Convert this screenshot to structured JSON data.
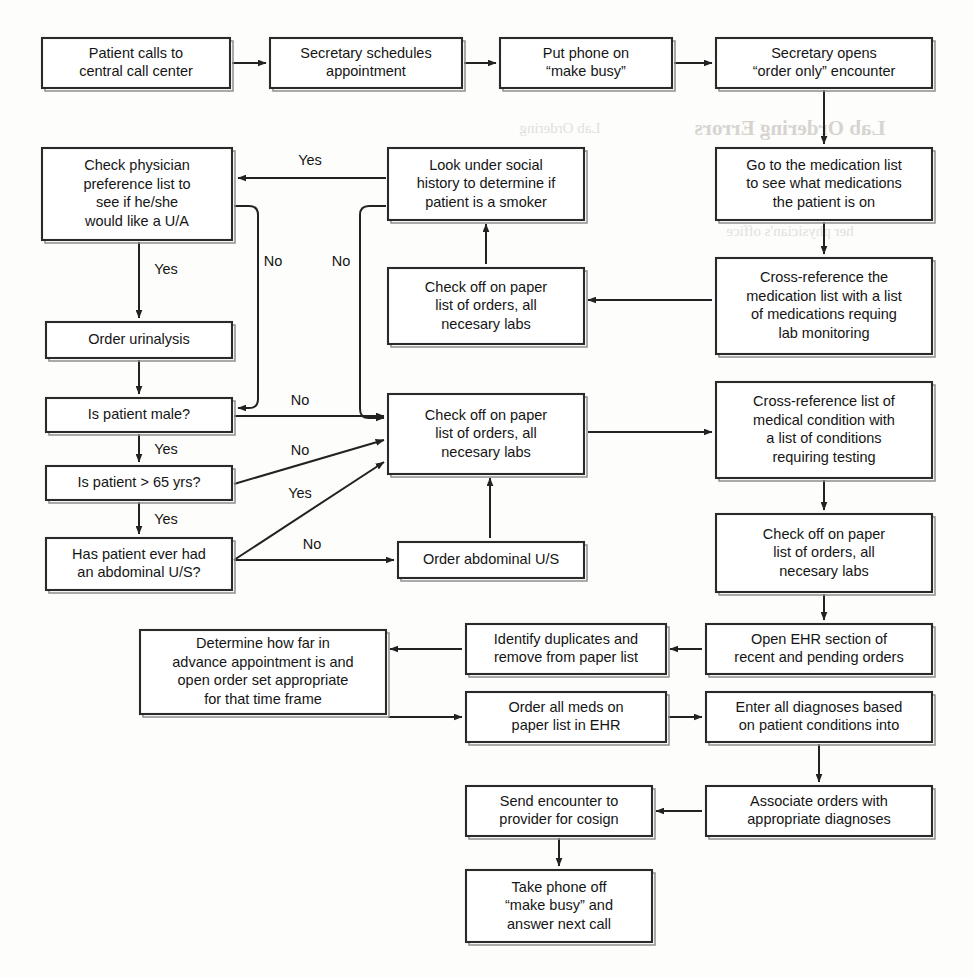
{
  "document": {
    "title": "Clinical Pre-Visit Lab Ordering Workflow",
    "page_background": "#fdfdfc",
    "ink_color": "#222222",
    "box_fill": "#ffffff"
  },
  "chart_data": {
    "type": "diagram",
    "diagram_kind": "flowchart",
    "orientation": "mixed",
    "node_count": 23,
    "edge_count": 26,
    "nodes": [
      {
        "id": "n1",
        "label": "Patient calls to\ncentral call center",
        "x": 42,
        "y": 38,
        "w": 188,
        "h": 50
      },
      {
        "id": "n2",
        "label": "Secretary schedules\nappointment",
        "x": 270,
        "y": 38,
        "w": 192,
        "h": 50
      },
      {
        "id": "n3",
        "label": "Put phone on\n“make busy”",
        "x": 500,
        "y": 38,
        "w": 172,
        "h": 50
      },
      {
        "id": "n4",
        "label": "Secretary opens\n“order only” encounter",
        "x": 716,
        "y": 38,
        "w": 216,
        "h": 50
      },
      {
        "id": "n5",
        "label": "Check physician\npreference list to\nsee if he/she\nwould like a U/A",
        "x": 42,
        "y": 148,
        "w": 190,
        "h": 92
      },
      {
        "id": "n6",
        "label": "Look under social\nhistory to determine if\npatient is a smoker",
        "x": 388,
        "y": 148,
        "w": 196,
        "h": 72
      },
      {
        "id": "n7",
        "label": "Go to the medication list\nto see what medications\nthe patient is on",
        "x": 716,
        "y": 148,
        "w": 216,
        "h": 72
      },
      {
        "id": "n8",
        "label": "Check off on paper\nlist of orders, all\nnecesary labs",
        "x": 388,
        "y": 268,
        "w": 196,
        "h": 76
      },
      {
        "id": "n9",
        "label": "Cross-reference the\nmedication list with a list\nof medications requing\nlab monitoring",
        "x": 716,
        "y": 258,
        "w": 216,
        "h": 96
      },
      {
        "id": "n10",
        "label": "Order urinalysis",
        "x": 46,
        "y": 322,
        "w": 186,
        "h": 36
      },
      {
        "id": "n11",
        "label": "Is patient male?",
        "x": 46,
        "y": 398,
        "w": 186,
        "h": 34
      },
      {
        "id": "n12",
        "label": "Check off on paper\nlist of orders, all\nnecesary labs",
        "x": 388,
        "y": 394,
        "w": 196,
        "h": 80
      },
      {
        "id": "n13",
        "label": "Cross-reference list of\nmedical condition with\na list of conditions\nrequiring testing",
        "x": 716,
        "y": 382,
        "w": 216,
        "h": 96
      },
      {
        "id": "n14",
        "label": "Is patient > 65 yrs?",
        "x": 46,
        "y": 466,
        "w": 186,
        "h": 34
      },
      {
        "id": "n15",
        "label": "Has patient ever had\nan abdominal U/S?",
        "x": 46,
        "y": 538,
        "w": 186,
        "h": 52
      },
      {
        "id": "n16",
        "label": "Order abdominal U/S",
        "x": 398,
        "y": 542,
        "w": 186,
        "h": 36
      },
      {
        "id": "n17",
        "label": "Check off on paper\nlist of orders, all\nnecesary labs",
        "x": 716,
        "y": 514,
        "w": 216,
        "h": 78
      },
      {
        "id": "n18",
        "label": "Open EHR section of\nrecent and pending orders",
        "x": 706,
        "y": 624,
        "w": 226,
        "h": 50
      },
      {
        "id": "n19",
        "label": "Identify duplicates and\nremove from paper list",
        "x": 466,
        "y": 624,
        "w": 200,
        "h": 50
      },
      {
        "id": "n20",
        "label": "Determine how far in\nadvance appointment is and\nopen order set appropriate\nfor that time frame",
        "x": 140,
        "y": 630,
        "w": 246,
        "h": 84
      },
      {
        "id": "n21",
        "label": "Order all meds on\npaper list in EHR",
        "x": 466,
        "y": 692,
        "w": 200,
        "h": 50
      },
      {
        "id": "n22",
        "label": "Enter all diagnoses based\non patient conditions into",
        "x": 706,
        "y": 692,
        "w": 226,
        "h": 50
      },
      {
        "id": "n23",
        "label": "Associate orders with\nappropriate diagnoses",
        "x": 706,
        "y": 786,
        "w": 226,
        "h": 50
      },
      {
        "id": "n24",
        "label": "Send encounter to\nprovider for cosign",
        "x": 466,
        "y": 786,
        "w": 186,
        "h": 50
      },
      {
        "id": "n25",
        "label": "Take phone off\n“make busy” and\nanswer next call",
        "x": 466,
        "y": 870,
        "w": 186,
        "h": 72
      }
    ],
    "edges": [
      {
        "id": "e1",
        "from": "n1",
        "to": "n2",
        "label": "",
        "points": "232,63 266,63",
        "arrow": "end"
      },
      {
        "id": "e2",
        "from": "n2",
        "to": "n3",
        "label": "",
        "points": "464,63 496,63",
        "arrow": "end"
      },
      {
        "id": "e3",
        "from": "n3",
        "to": "n4",
        "label": "",
        "points": "674,63 712,63",
        "arrow": "end"
      },
      {
        "id": "e4",
        "from": "n4",
        "to": "n7",
        "label": "",
        "points": "824,90 824,144",
        "arrow": "end"
      },
      {
        "id": "e5",
        "from": "n6",
        "to": "n5",
        "label": "Yes",
        "points": "386,178 238,178",
        "arrow": "end",
        "label_x": 310,
        "label_y": 161
      },
      {
        "id": "e6",
        "from": "n5",
        "to": "n11",
        "label": "No",
        "points": "234,206 258,206 258,408 238,408",
        "arrow": "end",
        "label_x": 273,
        "label_y": 262,
        "rounded": true
      },
      {
        "id": "e7",
        "from": "n5",
        "to": "n10",
        "label": "Yes",
        "points": "139,242 139,318",
        "arrow": "end",
        "label_x": 166,
        "label_y": 270
      },
      {
        "id": "e8",
        "from": "n10",
        "to": "n11",
        "label": "",
        "points": "139,360 139,394",
        "arrow": "end"
      },
      {
        "id": "e9",
        "from": "n11",
        "to": "n14",
        "label": "Yes",
        "points": "139,434 139,462",
        "arrow": "end",
        "label_x": 166,
        "label_y": 450
      },
      {
        "id": "e10",
        "from": "n14",
        "to": "n15",
        "label": "Yes",
        "points": "139,502 139,534",
        "arrow": "end",
        "label_x": 166,
        "label_y": 520
      },
      {
        "id": "e11",
        "from": "n6",
        "to": "n12",
        "label": "No",
        "points": "386,206 360,206 360,418 384,418",
        "arrow": "end",
        "label_x": 341,
        "label_y": 262,
        "rounded": true
      },
      {
        "id": "e12",
        "from": "n11",
        "to": "n12",
        "label": "No",
        "points": "234,416 384,416",
        "arrow": "end",
        "label_x": 300,
        "label_y": 401
      },
      {
        "id": "e13",
        "from": "n14",
        "to": "n12",
        "label": "No",
        "points": "234,484 384,440",
        "arrow": "end",
        "label_x": 300,
        "label_y": 451
      },
      {
        "id": "e14",
        "from": "n15",
        "to": "n12",
        "label": "Yes",
        "points": "234,560 384,462",
        "arrow": "end",
        "label_x": 300,
        "label_y": 494
      },
      {
        "id": "e15",
        "from": "n15",
        "to": "n16",
        "label": "No",
        "points": "234,560 394,560",
        "arrow": "end",
        "label_x": 312,
        "label_y": 545
      },
      {
        "id": "e16",
        "from": "n16",
        "to": "n12",
        "label": "",
        "points": "490,538 490,478",
        "arrow": "end"
      },
      {
        "id": "e17",
        "from": "n8",
        "to": "n6",
        "label": "",
        "points": "486,264 486,224",
        "arrow": "end"
      },
      {
        "id": "e18",
        "from": "n9",
        "to": "n8",
        "label": "",
        "points": "712,300 588,300",
        "arrow": "end"
      },
      {
        "id": "e19",
        "from": "n7",
        "to": "n9",
        "label": "",
        "points": "824,222 824,254",
        "arrow": "end"
      },
      {
        "id": "e20",
        "from": "n12",
        "to": "n13",
        "label": "",
        "points": "588,432 712,432",
        "arrow": "end"
      },
      {
        "id": "e21",
        "from": "n13",
        "to": "n17",
        "label": "",
        "points": "824,480 824,510",
        "arrow": "end"
      },
      {
        "id": "e22",
        "from": "n17",
        "to": "n18",
        "label": "",
        "points": "824,594 824,620",
        "arrow": "end"
      },
      {
        "id": "e23",
        "from": "n18",
        "to": "n19",
        "label": "",
        "points": "702,649 670,649",
        "arrow": "end"
      },
      {
        "id": "e24",
        "from": "n19",
        "to": "n20",
        "label": "",
        "points": "462,649 390,649",
        "arrow": "end"
      },
      {
        "id": "e25",
        "from": "n20",
        "to": "n21",
        "label": "",
        "points": "388,717 462,717",
        "arrow": "end"
      },
      {
        "id": "e26",
        "from": "n21",
        "to": "n22",
        "label": "",
        "points": "668,717 702,717",
        "arrow": "end"
      },
      {
        "id": "e27",
        "from": "n22",
        "to": "n23",
        "label": "",
        "points": "819,744 819,782",
        "arrow": "end"
      },
      {
        "id": "e28",
        "from": "n23",
        "to": "n24",
        "label": "",
        "points": "702,811 656,811",
        "arrow": "end"
      },
      {
        "id": "e29",
        "from": "n24",
        "to": "n25",
        "label": "",
        "points": "559,838 559,866",
        "arrow": "end"
      }
    ],
    "edge_label_values": [
      "Yes",
      "No"
    ],
    "legend": []
  },
  "scan_artifacts": {
    "description": "faint mirrored show-through text from the reverse of the scanned page",
    "marks": [
      {
        "id": "a1",
        "text": "Lab Ordering Errors",
        "x": 790,
        "y": 130,
        "size": "large"
      },
      {
        "id": "a2",
        "text": "her physician's office",
        "x": 790,
        "y": 233,
        "size": "small"
      },
      {
        "id": "a3",
        "text": "a list of medications",
        "x": 800,
        "y": 300,
        "size": "small"
      },
      {
        "id": "a4",
        "text": "Lab Ordering",
        "x": 560,
        "y": 130,
        "size": "small"
      }
    ]
  }
}
